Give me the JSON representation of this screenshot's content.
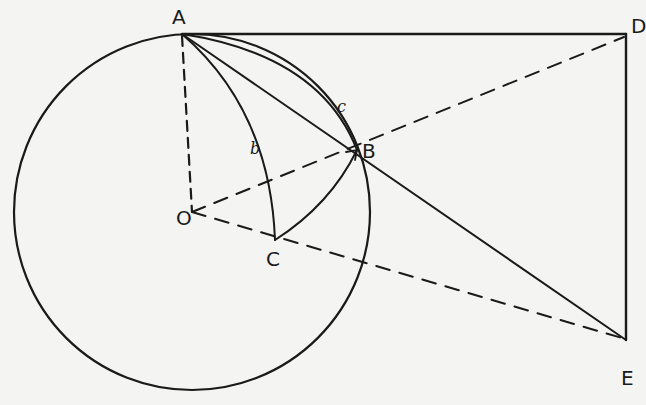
{
  "diagram": {
    "type": "geometry",
    "colors": {
      "stroke": "#1a1a1a",
      "background": "#f4f4f2"
    },
    "points": {
      "A": {
        "label": "A"
      },
      "B": {
        "label": "B"
      },
      "C": {
        "label": "C"
      },
      "D": {
        "label": "D"
      },
      "E": {
        "label": "E"
      },
      "O": {
        "label": "O"
      }
    },
    "arcs": {
      "b": {
        "label": "b"
      },
      "c": {
        "label": "c"
      }
    },
    "solid_lines": [
      "A-D",
      "D-E",
      "A-E"
    ],
    "dashed_lines": [
      "A-O",
      "O-D",
      "O-E"
    ],
    "curves": [
      "circle O",
      "arc A-C (b)",
      "arc A-B (c)",
      "arc C-B"
    ]
  }
}
